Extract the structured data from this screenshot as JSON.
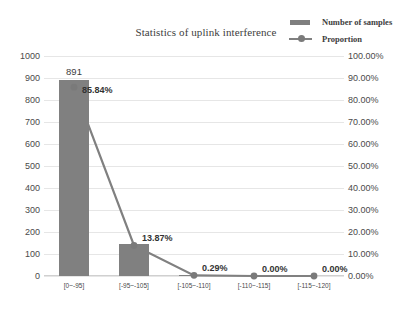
{
  "chart_data": {
    "type": "bar",
    "title": "Statistics of uplink interference",
    "xlabel": "",
    "ylabel": "",
    "categories": [
      "[0~-95]",
      "[-95~-105]",
      "[-105~-110]",
      "[-110~-115]",
      "[-115~-120]"
    ],
    "series": [
      {
        "name": "Number of samples",
        "type": "bar",
        "axis": "left",
        "values": [
          891,
          144,
          3,
          0,
          0
        ],
        "color": "#808080",
        "data_labels": [
          "891",
          "",
          "",
          "",
          ""
        ]
      },
      {
        "name": "Proportion",
        "type": "line",
        "axis": "right",
        "values": [
          85.84,
          13.87,
          0.29,
          0.0,
          0.0
        ],
        "color": "#808080",
        "data_labels": [
          "85.84%",
          "13.87%",
          "0.29%",
          "0.00%",
          "0.00%"
        ]
      }
    ],
    "ylim": [
      0,
      1000
    ],
    "y2lim": [
      0,
      100
    ],
    "left_axis_ticks": [
      "1000",
      "900",
      "800",
      "700",
      "600",
      "500",
      "400",
      "300",
      "200",
      "100",
      "0"
    ],
    "right_axis_ticks": [
      "100.00%",
      "90.00%",
      "80.00%",
      "70.00%",
      "60.00%",
      "50.00%",
      "40.00%",
      "30.00%",
      "20.00%",
      "10.00%",
      "0.00%"
    ],
    "grid": true,
    "legend_position": "top-right"
  },
  "legend": {
    "items": [
      {
        "label": "Number of samples",
        "marker": "bar-swatch"
      },
      {
        "label": "Proportion",
        "marker": "line-marker-swatch"
      }
    ]
  },
  "caption": {
    "text": ""
  }
}
